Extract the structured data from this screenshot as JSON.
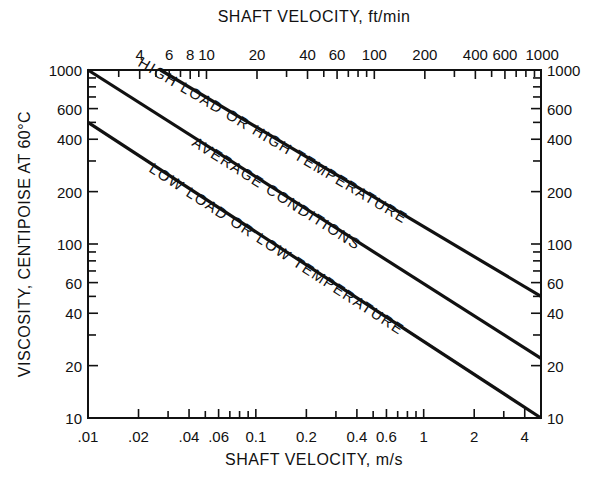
{
  "chart_data": {
    "type": "line",
    "scale": "log-log",
    "title": "",
    "xlabel": "SHAFT VELOCITY, m/s",
    "x2label": "SHAFT VELOCITY, ft/min",
    "ylabel": "VISCOSITY, CENTIPOISE AT 60°C",
    "xlim": [
      0.01,
      5
    ],
    "ylim": [
      10,
      1000
    ],
    "grid": false,
    "x_ticks": [
      0.01,
      0.02,
      0.04,
      0.06,
      0.1,
      0.2,
      0.4,
      0.6,
      1,
      2,
      4
    ],
    "x_tick_labels": [
      ".01",
      ".02",
      ".04",
      ".06",
      "0.1",
      "0.2",
      "0.4",
      "0.6",
      "1",
      "2",
      "4"
    ],
    "x_minor_ticks": [
      0.03,
      0.05,
      0.07,
      0.08,
      0.09,
      0.3,
      0.5,
      0.7,
      0.8,
      0.9,
      3
    ],
    "x2_ticks_ftmin": [
      4,
      6,
      8,
      10,
      20,
      40,
      60,
      100,
      200,
      400,
      600,
      1000
    ],
    "x2_tick_labels": [
      "4",
      "6",
      "8",
      "10",
      "20",
      "40",
      "60",
      "100",
      "200",
      "400",
      "600",
      "1000"
    ],
    "x2_minor_ticks_ftmin": [
      3,
      5,
      7,
      9,
      30,
      50,
      70,
      80,
      90,
      300,
      500,
      700,
      800,
      900
    ],
    "y_ticks": [
      10,
      20,
      40,
      60,
      100,
      200,
      400,
      600,
      1000
    ],
    "y_tick_labels": [
      "10",
      "20",
      "40",
      "60",
      "100",
      "200",
      "400",
      "600",
      "1000"
    ],
    "y_minor_ticks": [
      30,
      50,
      70,
      80,
      90,
      300,
      500,
      700,
      800,
      900
    ],
    "series": [
      {
        "name": "HIGH LOAD OR HIGH TEMPERATURE",
        "x": [
          0.027,
          5
        ],
        "y": [
          1000,
          50
        ]
      },
      {
        "name": "AVERAGE CONDITIONS",
        "x": [
          0.01,
          5
        ],
        "y": [
          1000,
          22
        ]
      },
      {
        "name": "LOW LOAD OR LOW TEMPERATURE",
        "x": [
          0.01,
          5
        ],
        "y": [
          500,
          10
        ]
      }
    ],
    "ft_per_min_per_m_per_s": 196.85
  },
  "colors": {
    "ink": "#111111",
    "background": "#ffffff"
  }
}
